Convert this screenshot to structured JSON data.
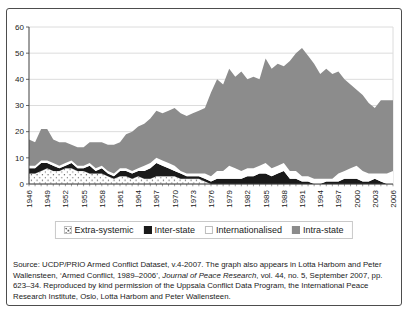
{
  "figure": {
    "source_note": {
      "prefix": "Source: UCDP/PRIO Armed Conflict Dataset, v.4-2007. The graph also appears in Lotta Harbom and Peter Wallensteen, ‘Armed Conflict, 1989–2006’, ",
      "italic": "Journal of Peace Research",
      "suffix": ", vol. 44, no. 5, September 2007, pp. 623–34. Reproduced by kind permission of the Uppsala Conflict Data Program, the International Peace Research Institute, Oslo, Lotta Harbom and Peter Wallensteen."
    },
    "colors": {
      "intra_state_fill": "#8c8c8c",
      "inter_state_fill": "#1a1a1a",
      "internationalised_fill": "#ffffff",
      "extra_systemic_fill": "stipple-dots-on-white",
      "gridline": "#dcdcdc",
      "axis": "#3f3f3f",
      "frame_border": "#4d4d4d",
      "text": "#1a1a1a"
    }
  },
  "chart_data": {
    "type": "area",
    "stacked": true,
    "title": "",
    "xlabel": "",
    "ylabel": "",
    "x_start": 1946,
    "x_end": 2006,
    "xticks": [
      1946,
      1949,
      1952,
      1955,
      1958,
      1961,
      1964,
      1967,
      1970,
      1973,
      1976,
      1979,
      1982,
      1985,
      1988,
      1991,
      1994,
      1997,
      2000,
      2003,
      2006
    ],
    "yticks": [
      0,
      10,
      20,
      30,
      40,
      50,
      60
    ],
    "ylim": [
      0,
      60
    ],
    "grid": "horizontal",
    "legend_position": "bottom",
    "series": [
      {
        "name": "Extra-systemic",
        "style": "stipple",
        "values": [
          4,
          4,
          5,
          6,
          5,
          5,
          6,
          6,
          5,
          5,
          4,
          4,
          4,
          3,
          2,
          3,
          3,
          2,
          3,
          2,
          2,
          3,
          3,
          3,
          3,
          2,
          2,
          2,
          2,
          1,
          0,
          0,
          0,
          0,
          0,
          0,
          0,
          0,
          0,
          0,
          0,
          0,
          0,
          0,
          0,
          0,
          0,
          0,
          0,
          0,
          0,
          0,
          0,
          0,
          0,
          0,
          0,
          0,
          0,
          0,
          0
        ]
      },
      {
        "name": "Inter-state",
        "style": "solid",
        "color": "#1a1a1a",
        "values": [
          2,
          2,
          3,
          2,
          2,
          1,
          1,
          2,
          1,
          1,
          3,
          1,
          2,
          1,
          1,
          2,
          2,
          2,
          2,
          3,
          4,
          5,
          4,
          3,
          2,
          2,
          1,
          1,
          1,
          1,
          1,
          2,
          2,
          2,
          2,
          2,
          3,
          3,
          4,
          4,
          3,
          4,
          5,
          2,
          2,
          1,
          1,
          0,
          0,
          1,
          1,
          1,
          2,
          2,
          2,
          1,
          1,
          2,
          1,
          0,
          0
        ]
      },
      {
        "name": "Internationalised",
        "style": "solid",
        "color": "#ffffff",
        "values": [
          1,
          1,
          1,
          1,
          1,
          1,
          1,
          1,
          1,
          1,
          1,
          1,
          1,
          1,
          1,
          1,
          1,
          1,
          1,
          2,
          2,
          2,
          2,
          2,
          2,
          1,
          1,
          1,
          1,
          2,
          2,
          3,
          3,
          5,
          4,
          3,
          3,
          3,
          3,
          4,
          3,
          3,
          3,
          3,
          3,
          2,
          2,
          2,
          2,
          1,
          1,
          3,
          3,
          4,
          5,
          4,
          3,
          2,
          3,
          4,
          5
        ]
      },
      {
        "name": "Intra-state",
        "style": "solid",
        "color": "#8c8c8c",
        "values": [
          10,
          9,
          12,
          12,
          9,
          9,
          8,
          6,
          7,
          7,
          8,
          10,
          9,
          10,
          11,
          10,
          13,
          15,
          16,
          16,
          17,
          18,
          18,
          20,
          22,
          22,
          22,
          23,
          24,
          25,
          32,
          35,
          33,
          37,
          35,
          38,
          34,
          35,
          33,
          40,
          38,
          39,
          37,
          42,
          45,
          49,
          46,
          44,
          40,
          42,
          40,
          39,
          35,
          32,
          29,
          29,
          27,
          25,
          28,
          28,
          27
        ]
      }
    ]
  }
}
